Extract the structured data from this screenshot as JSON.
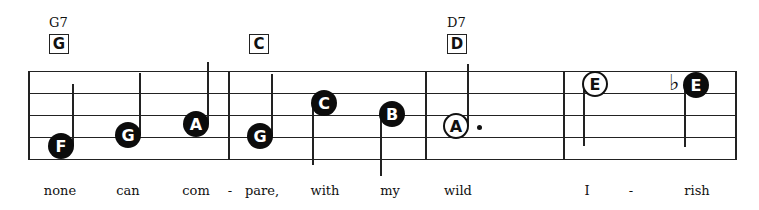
{
  "chords": [
    {
      "name": "G7",
      "box": "G",
      "x": 49
    },
    {
      "name": "",
      "box": "C",
      "x": 249
    },
    {
      "name": "D7",
      "box": "D",
      "x": 447
    }
  ],
  "staff": {
    "left": 28,
    "right": 735,
    "lines_y": [
      71,
      93,
      115,
      137,
      159
    ],
    "barlines_x": [
      28,
      228,
      425,
      563,
      735
    ]
  },
  "notes": [
    {
      "letter": "F",
      "style": "filled",
      "cx": 61,
      "cy": 146,
      "stem": "up"
    },
    {
      "letter": "G",
      "style": "filled",
      "cx": 128,
      "cy": 135,
      "stem": "up"
    },
    {
      "letter": "A",
      "style": "filled",
      "cx": 196,
      "cy": 124,
      "stem": "up"
    },
    {
      "letter": "G",
      "style": "filled",
      "cx": 260,
      "cy": 136,
      "stem": "up"
    },
    {
      "letter": "C",
      "style": "filled",
      "cx": 324,
      "cy": 103,
      "stem": "down"
    },
    {
      "letter": "B",
      "style": "filled",
      "cx": 392,
      "cy": 114,
      "stem": "down"
    },
    {
      "letter": "A",
      "style": "open",
      "cx": 456,
      "cy": 126,
      "stem": "up",
      "dotted": true
    },
    {
      "letter": "E",
      "style": "open",
      "cx": 595,
      "cy": 84,
      "stem": "down"
    },
    {
      "letter": "E",
      "style": "filled",
      "cx": 696,
      "cy": 85,
      "stem": "down",
      "accidental": "♭"
    }
  ],
  "lyrics": [
    {
      "text": "none",
      "x": 60
    },
    {
      "text": "can",
      "x": 128
    },
    {
      "text": "com",
      "x": 196
    },
    {
      "text": "-",
      "x": 230
    },
    {
      "text": "pare,",
      "x": 262
    },
    {
      "text": "with",
      "x": 325
    },
    {
      "text": "my",
      "x": 390
    },
    {
      "text": "wild",
      "x": 458
    },
    {
      "text": "I",
      "x": 587
    },
    {
      "text": "-",
      "x": 631
    },
    {
      "text": "rish",
      "x": 697
    }
  ]
}
